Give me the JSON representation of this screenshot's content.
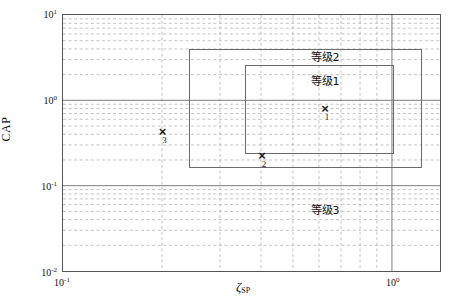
{
  "chart_data": {
    "type": "scatter",
    "title": "",
    "xlabel": "ζ_SP",
    "ylabel": "CAP",
    "xscale": "log",
    "yscale": "log",
    "xlim": [
      0.1,
      1.4
    ],
    "ylim": [
      0.01,
      10
    ],
    "grid": true,
    "grid_style": "dashed minor and major log grid",
    "legend": "none",
    "xticks": [
      "10^-1",
      "10^0"
    ],
    "xtick_labels": [
      "10⁻¹",
      "10⁰"
    ],
    "yticks": [
      "10^-2",
      "10^-1",
      "10^0",
      "10^1"
    ],
    "ytick_labels": [
      "10⁻²",
      "10⁻¹",
      "10⁰",
      "10¹"
    ],
    "points": [
      {
        "label": "1",
        "marker": "x",
        "x": 0.62,
        "y": 0.82
      },
      {
        "label": "2",
        "marker": "x",
        "x": 0.4,
        "y": 0.235
      },
      {
        "label": "3",
        "marker": "x",
        "x": 0.2,
        "y": 0.45
      }
    ],
    "zones": [
      {
        "name": "等级1",
        "x_range": [
          0.355,
          1.0
        ],
        "y_range": [
          0.245,
          2.6
        ]
      },
      {
        "name": "等级2",
        "x_range": [
          0.24,
          1.22
        ],
        "y_range": [
          0.165,
          4.0
        ]
      },
      {
        "name": "等级3",
        "x_range": [
          0.1,
          1.4
        ],
        "y_range": [
          0.01,
          10
        ]
      }
    ],
    "annotations": [
      {
        "text": "等级2",
        "x": 0.62,
        "y": 3.35
      },
      {
        "text": "等级1",
        "x": 0.62,
        "y": 1.75
      },
      {
        "text": "等级3",
        "x": 0.62,
        "y": 0.055
      }
    ]
  },
  "axes": {
    "y_axis_title": "CAP",
    "x_axis_zeta": "ζ",
    "x_axis_sub": "SP",
    "ytick_top": {
      "base": "10",
      "exp": "1"
    },
    "ytick_1": {
      "base": "10",
      "exp": "0"
    },
    "ytick_2": {
      "base": "10",
      "exp": "-1"
    },
    "ytick_bottom": {
      "base": "10",
      "exp": "-2"
    },
    "xtick_left": {
      "base": "10",
      "exp": "-1"
    },
    "xtick_right": {
      "base": "10",
      "exp": "0"
    }
  },
  "labels": {
    "zone1": "等级1",
    "zone2": "等级2",
    "zone3": "等级3",
    "point1": "1",
    "point2": "2",
    "point3": "3",
    "marker": "×"
  },
  "colors": {
    "frame": "#555555",
    "grid": "#9a9a9a",
    "zone_border": "#6b6b6b",
    "marker": "#1a1a1a",
    "background": "#ffffff"
  }
}
